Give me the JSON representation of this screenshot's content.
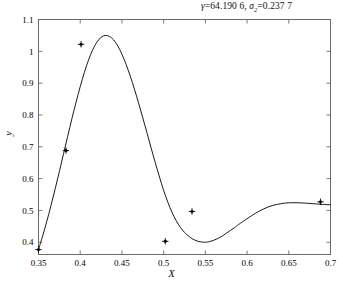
{
  "chart_data": {
    "type": "line",
    "title_parts": {
      "gamma_symbol": "γ",
      "gamma_value": "=64.190 6, ",
      "sigma_symbol": "σ",
      "sigma_subscript": "2",
      "sigma_value": "=0.237 7"
    },
    "xlabel": "X",
    "ylabel": "y",
    "xlim": [
      0.35,
      0.7
    ],
    "ylim": [
      0.3615,
      1.1
    ],
    "xticks": [
      0.35,
      0.4,
      0.45,
      0.5,
      0.55,
      0.6,
      0.65,
      0.7
    ],
    "xticklabels": [
      "0.35",
      "0.4",
      "0.45",
      "0.5",
      "0.55",
      "0.6",
      "0.65",
      "0.7"
    ],
    "yticks": [
      0.4,
      0.5,
      0.6,
      0.7,
      0.8,
      0.9,
      1.0,
      1.1
    ],
    "yticklabels": [
      "0.4",
      "0.5",
      "0.6",
      "0.7",
      "0.8",
      "0.9",
      "1",
      "1.1"
    ],
    "grid": false,
    "legend": "none",
    "line_color": "#1a1a1a",
    "marker_color": "#000000",
    "marker_style": "plus-dot",
    "series": [
      {
        "name": "fitted-curve",
        "kind": "curve",
        "x": [
          0.35,
          0.355,
          0.36,
          0.365,
          0.37,
          0.375,
          0.38,
          0.385,
          0.39,
          0.395,
          0.4,
          0.405,
          0.41,
          0.415,
          0.42,
          0.425,
          0.43,
          0.435,
          0.44,
          0.445,
          0.45,
          0.455,
          0.46,
          0.465,
          0.47,
          0.475,
          0.48,
          0.485,
          0.49,
          0.495,
          0.5,
          0.505,
          0.51,
          0.515,
          0.52,
          0.525,
          0.53,
          0.535,
          0.54,
          0.545,
          0.55,
          0.555,
          0.56,
          0.565,
          0.57,
          0.575,
          0.58,
          0.585,
          0.59,
          0.6,
          0.61,
          0.62,
          0.63,
          0.64,
          0.65,
          0.66,
          0.67,
          0.68,
          0.69,
          0.7
        ],
        "y": [
          0.377,
          0.42,
          0.466,
          0.516,
          0.568,
          0.622,
          0.678,
          0.733,
          0.788,
          0.84,
          0.889,
          0.934,
          0.973,
          1.005,
          1.029,
          1.044,
          1.05,
          1.047,
          1.036,
          1.017,
          0.991,
          0.959,
          0.922,
          0.881,
          0.837,
          0.791,
          0.744,
          0.696,
          0.65,
          0.605,
          0.563,
          0.526,
          0.494,
          0.468,
          0.447,
          0.431,
          0.419,
          0.41,
          0.404,
          0.401,
          0.4,
          0.402,
          0.406,
          0.412,
          0.419,
          0.428,
          0.437,
          0.446,
          0.456,
          0.474,
          0.491,
          0.505,
          0.515,
          0.521,
          0.524,
          0.524,
          0.523,
          0.521,
          0.519,
          0.518
        ]
      },
      {
        "name": "data-points",
        "kind": "markers",
        "points": [
          {
            "x": 0.35,
            "y": 0.377
          },
          {
            "x": 0.383,
            "y": 0.688
          },
          {
            "x": 0.401,
            "y": 1.022
          },
          {
            "x": 0.502,
            "y": 0.403
          },
          {
            "x": 0.534,
            "y": 0.497
          },
          {
            "x": 0.688,
            "y": 0.527
          }
        ]
      }
    ]
  },
  "figure": {
    "background": "#ffffff",
    "frame_color": "#6b6b6b"
  }
}
